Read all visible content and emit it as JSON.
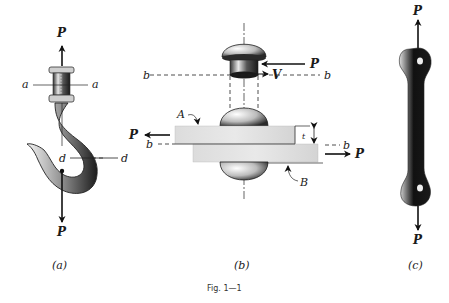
{
  "figure": {
    "caption": "Fig.  1—1",
    "panels": [
      {
        "id": "a",
        "caption": "(a)",
        "subject": "crane hook with threaded shank",
        "labels": {
          "load_top": "P",
          "load_bottom": "P",
          "section_a_left": "a",
          "section_a_right": "a",
          "section_d_left": "d",
          "section_d_right": "d"
        }
      },
      {
        "id": "b",
        "caption": "(b)",
        "subject": "riveted lap joint",
        "labels": {
          "force_top": "P",
          "shear": "V",
          "plane_b_top_left": "b",
          "plane_b_top_right": "b",
          "plate_a": "A",
          "plate_b": "B",
          "force_left": "P",
          "force_right": "P",
          "plane_b_mid_left": "b",
          "plane_b_mid_right": "b",
          "thickness": "t"
        }
      },
      {
        "id": "c",
        "caption": "(c)",
        "subject": "eyebar link",
        "labels": {
          "load_top": "P",
          "load_bottom": "P"
        }
      }
    ]
  }
}
